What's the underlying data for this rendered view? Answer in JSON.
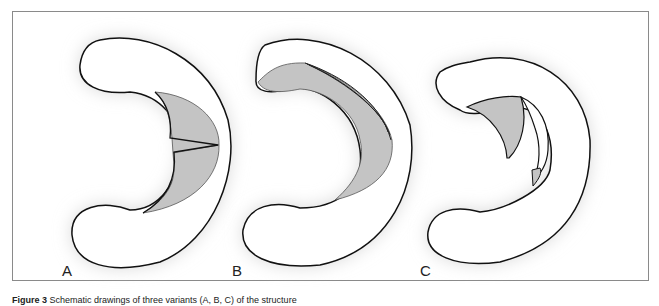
{
  "figure": {
    "panels": [
      {
        "label": "A",
        "description": "C-shaped structure with shaded inner region and V-shaped notch"
      },
      {
        "label": "B",
        "description": "C-shaped structure with shaded crescent and layered flap lines"
      },
      {
        "label": "C",
        "description": "C-shaped structure with separated shaded flap segments"
      }
    ],
    "colors": {
      "outline": "#111111",
      "fill": "#ffffff",
      "shaded": "#c4c4c4",
      "halo": "#d8d8d8",
      "frame": "#8a8a8a"
    },
    "caption": {
      "prefix": "Figure 3",
      "text": "Schematic drawings of three variants (A, B, C) of the structure"
    }
  }
}
